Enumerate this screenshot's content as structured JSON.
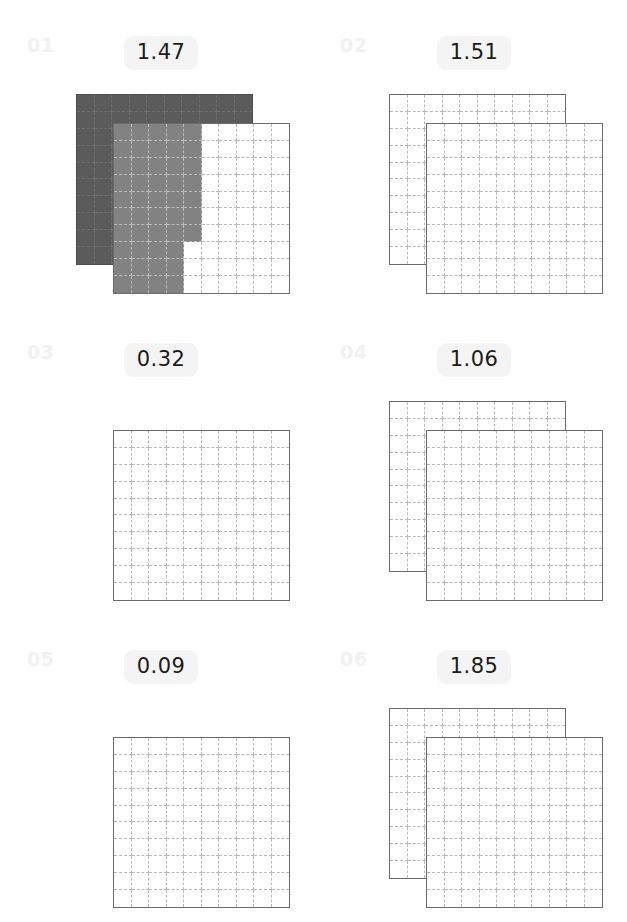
{
  "page": {
    "background_color": "#ffffff",
    "layout": "2-column x 3-row panel grid",
    "grid_subdivisions": 10,
    "cells_per_square": 100
  },
  "style": {
    "badge_background": "#f4f4f4",
    "badge_text_color": "#1b1b1b",
    "index_color": "#f1f1f1",
    "square_border_color": "#6a6a6a",
    "cell_line_color": "#b9b9b9",
    "fill_dark": "#5b5b5b",
    "fill_mid": "#828282",
    "fill_light": "#9a9a9a"
  },
  "panels": [
    {
      "index": "01",
      "value": "1.47",
      "squares": 2,
      "shaded": true,
      "back_fill": "full",
      "front_filled_cells": 47,
      "front_rows": [
        5,
        5,
        5,
        5,
        5,
        5,
        5,
        4,
        4,
        4
      ]
    },
    {
      "index": "02",
      "value": "1.51",
      "squares": 2,
      "shaded": false,
      "back_fill": "none",
      "front_filled_cells": 0,
      "front_rows": [
        0,
        0,
        0,
        0,
        0,
        0,
        0,
        0,
        0,
        0
      ]
    },
    {
      "index": "03",
      "value": "0.32",
      "squares": 1,
      "shaded": false,
      "back_fill": "none",
      "front_filled_cells": 0,
      "front_rows": [
        0,
        0,
        0,
        0,
        0,
        0,
        0,
        0,
        0,
        0
      ]
    },
    {
      "index": "04",
      "value": "1.06",
      "squares": 2,
      "shaded": false,
      "back_fill": "none",
      "front_filled_cells": 0,
      "front_rows": [
        0,
        0,
        0,
        0,
        0,
        0,
        0,
        0,
        0,
        0
      ]
    },
    {
      "index": "05",
      "value": "0.09",
      "squares": 1,
      "shaded": false,
      "back_fill": "none",
      "front_filled_cells": 0,
      "front_rows": [
        0,
        0,
        0,
        0,
        0,
        0,
        0,
        0,
        0,
        0
      ]
    },
    {
      "index": "06",
      "value": "1.85",
      "squares": 2,
      "shaded": false,
      "back_fill": "none",
      "front_filled_cells": 0,
      "front_rows": [
        0,
        0,
        0,
        0,
        0,
        0,
        0,
        0,
        0,
        0
      ]
    }
  ],
  "chart_data": {
    "type": "bar",
    "title": "",
    "xlabel": "",
    "ylabel": "",
    "categories": [
      "01",
      "02",
      "03",
      "04",
      "05",
      "06"
    ],
    "values": [
      1.47,
      1.51,
      0.32,
      1.06,
      0.09,
      1.85
    ],
    "ylim": [
      0,
      2
    ],
    "grid": true,
    "legend": "none"
  }
}
